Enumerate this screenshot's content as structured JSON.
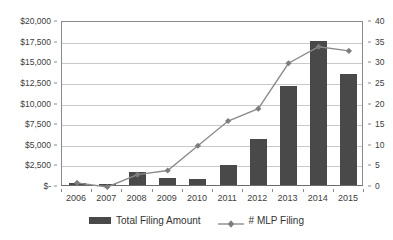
{
  "chart_data": {
    "type": "bar",
    "title": "",
    "subtitle": "",
    "xlabel": "",
    "ylabel": "",
    "categories": [
      "2006",
      "2007",
      "2008",
      "2009",
      "2010",
      "2011",
      "2012",
      "2013",
      "2014",
      "2015"
    ],
    "series": [
      {
        "name": "Total Filing Amount",
        "type": "bar",
        "axis": "left",
        "color": "#494949",
        "values": [
          250,
          60,
          1550,
          900,
          700,
          2450,
          5600,
          12000,
          17500,
          13400
        ]
      },
      {
        "name": "# MLP Filing",
        "type": "line",
        "axis": "right",
        "color": "#8c8c8c",
        "marker": "diamond",
        "values": [
          1,
          0,
          3,
          4,
          10,
          16,
          19,
          30,
          34,
          33
        ]
      }
    ],
    "y_left": {
      "label": "",
      "ticks": [
        "$-",
        "$2,500",
        "$5,000",
        "$7,500",
        "$10,000",
        "$12,500",
        "$15,000",
        "$17,500",
        "$20,000"
      ],
      "tick_values": [
        0,
        2500,
        5000,
        7500,
        10000,
        12500,
        15000,
        17500,
        20000
      ],
      "ylim": [
        0,
        20000
      ]
    },
    "y_right": {
      "label": "",
      "ticks": [
        "0",
        "5",
        "10",
        "15",
        "20",
        "25",
        "30",
        "35",
        "40"
      ],
      "tick_values": [
        0,
        5,
        10,
        15,
        20,
        25,
        30,
        35,
        40
      ],
      "ylim": [
        0,
        40
      ]
    },
    "grid": true,
    "legend_position": "bottom"
  },
  "legend": {
    "bar_label": "Total Filing Amount",
    "line_label": "# MLP Filing"
  },
  "colors": {
    "bar": "#494949",
    "line": "#8c8c8c",
    "grid": "#c9c9c9",
    "axis": "#8a8a8a",
    "text": "#404040"
  }
}
